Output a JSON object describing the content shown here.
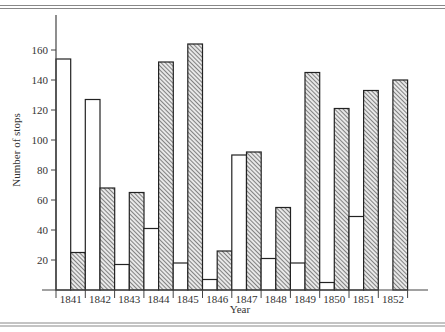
{
  "chart_data": {
    "type": "bar",
    "title": "",
    "xlabel": "Year",
    "ylabel": "Number of stops",
    "ylim": [
      0,
      170
    ],
    "yticks": [
      20,
      40,
      60,
      80,
      100,
      120,
      140,
      160
    ],
    "grid": false,
    "legend": null,
    "categories": [
      "1841",
      "1842",
      "1843",
      "1844",
      "1845",
      "1846",
      "1847",
      "1848",
      "1849",
      "1850",
      "1851",
      "1852"
    ],
    "series": [
      {
        "name": "Series A (open bars)",
        "style": "white",
        "values": [
          154,
          127,
          17,
          41,
          18,
          7,
          90,
          21,
          18,
          5,
          49,
          0
        ]
      },
      {
        "name": "Series B (hatched bars)",
        "style": "hatched",
        "values": [
          25,
          68,
          65,
          152,
          164,
          26,
          92,
          55,
          145,
          121,
          133,
          140
        ]
      }
    ]
  },
  "colors": {
    "axis": "#444444",
    "bar_outline": "#222222",
    "hatch": "#555555",
    "rule": "#888888"
  }
}
